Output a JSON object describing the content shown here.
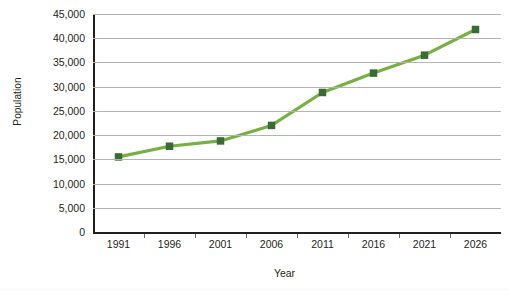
{
  "chart_data": {
    "type": "line",
    "title": "",
    "xlabel": "Year",
    "ylabel": "Population",
    "categories": [
      "1991",
      "1996",
      "2001",
      "2006",
      "2011",
      "2016",
      "2021",
      "2026"
    ],
    "x": [
      1991,
      1996,
      2001,
      2006,
      2011,
      2016,
      2021,
      2026
    ],
    "values": [
      15500,
      17700,
      18800,
      22000,
      28800,
      32800,
      36500,
      41800
    ],
    "series": [
      {
        "name": "Population",
        "values": [
          15500,
          17700,
          18800,
          22000,
          28800,
          32800,
          36500,
          41800
        ]
      }
    ],
    "ylim": [
      0,
      45000
    ],
    "ytick_values": [
      0,
      5000,
      10000,
      15000,
      20000,
      25000,
      30000,
      35000,
      40000,
      45000
    ],
    "ytick_labels": [
      "0",
      "5,000",
      "10,000",
      "15,000",
      "20,000",
      "25,000",
      "30,000",
      "35,000",
      "40,000",
      "45,000"
    ],
    "grid": "horizontal",
    "legend": "none",
    "line_color": "#76b043",
    "marker_color": "#3a6b35",
    "marker_shape": "square",
    "gridline_color": "#b3b3b3",
    "axis_color": "#231f20",
    "background_color": "#ffffff"
  }
}
